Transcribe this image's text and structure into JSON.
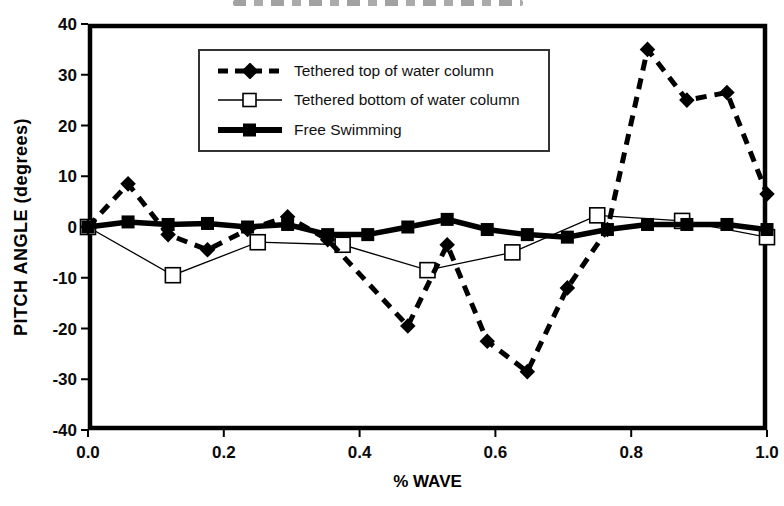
{
  "figure": {
    "background": "#ffffff",
    "ink_color": "#000000"
  },
  "chart_data": {
    "type": "line",
    "title": "",
    "xlabel": "% WAVE",
    "ylabel": "PITCH ANGLE (degrees)",
    "xlim": [
      0.0,
      1.0
    ],
    "ylim": [
      -40,
      40
    ],
    "xticks": [
      0.0,
      0.2,
      0.4,
      0.6,
      0.8,
      1.0
    ],
    "yticks": [
      40,
      30,
      20,
      10,
      0,
      -10,
      -20,
      -30,
      -40
    ],
    "grid": "off",
    "legend_position": "upper-left-inside",
    "series": [
      {
        "name": "Tethered top of water column",
        "line_style": "dashed",
        "line_width": "medium",
        "marker": "filled-diamond",
        "points": [
          [
            0.0,
            0
          ],
          [
            0.059,
            8.5
          ],
          [
            0.118,
            -1.5
          ],
          [
            0.176,
            -4.5
          ],
          [
            0.235,
            -0.5
          ],
          [
            0.294,
            2.0
          ],
          [
            0.353,
            -2.5
          ],
          [
            0.471,
            -19.5
          ],
          [
            0.529,
            -3.5
          ],
          [
            0.588,
            -22.5
          ],
          [
            0.647,
            -28.5
          ],
          [
            0.706,
            -12.0
          ],
          [
            0.765,
            -0.5
          ],
          [
            0.824,
            35.0
          ],
          [
            0.882,
            25.0
          ],
          [
            0.941,
            26.5
          ],
          [
            1.0,
            6.5
          ]
        ]
      },
      {
        "name": "Tethered bottom of water column",
        "line_style": "solid",
        "line_width": "thin",
        "marker": "open-square",
        "points": [
          [
            0.0,
            0
          ],
          [
            0.125,
            -9.5
          ],
          [
            0.25,
            -3.0
          ],
          [
            0.375,
            -3.5
          ],
          [
            0.5,
            -8.5
          ],
          [
            0.625,
            -5.0
          ],
          [
            0.75,
            2.3
          ],
          [
            0.875,
            1.2
          ],
          [
            1.0,
            -2.0
          ]
        ]
      },
      {
        "name": "Free Swimming",
        "line_style": "solid",
        "line_width": "thick",
        "marker": "filled-square",
        "points": [
          [
            0.0,
            0
          ],
          [
            0.059,
            1.0
          ],
          [
            0.118,
            0.5
          ],
          [
            0.176,
            0.7
          ],
          [
            0.235,
            0.0
          ],
          [
            0.294,
            0.5
          ],
          [
            0.353,
            -1.5
          ],
          [
            0.412,
            -1.5
          ],
          [
            0.471,
            0.0
          ],
          [
            0.529,
            1.5
          ],
          [
            0.588,
            -0.5
          ],
          [
            0.647,
            -1.5
          ],
          [
            0.706,
            -2.0
          ],
          [
            0.765,
            -0.5
          ],
          [
            0.824,
            0.5
          ],
          [
            0.882,
            0.5
          ],
          [
            0.941,
            0.5
          ],
          [
            1.0,
            -0.5
          ]
        ]
      }
    ]
  }
}
